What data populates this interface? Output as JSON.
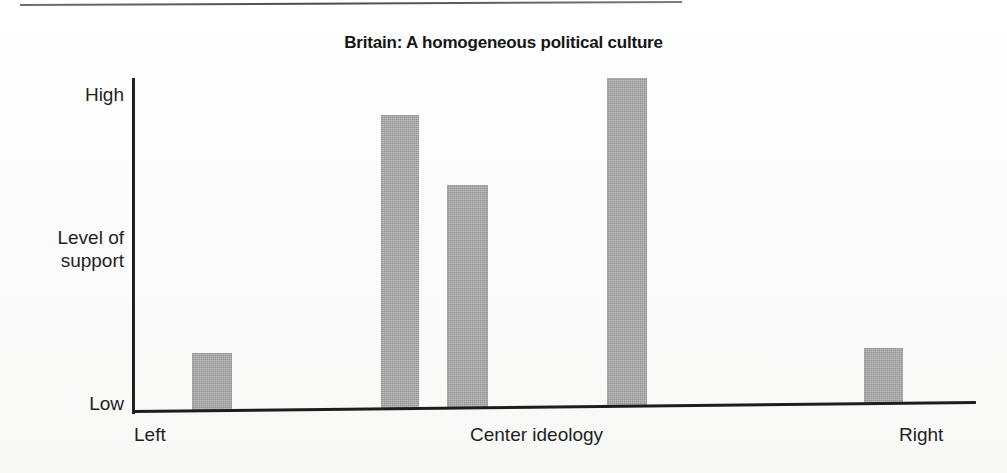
{
  "figure": {
    "title": "Britain: A homogeneous political culture",
    "top_rule": "divider-line"
  },
  "axes": {
    "y_top_label": "High",
    "y_middle_label": "Level of\nsupport",
    "y_bottom_label": "Low",
    "x_left_label": "Left",
    "x_center_label": "Center ideology",
    "x_right_label": "Right"
  },
  "colors": {
    "bar_fill": "#a3a3a3",
    "axis": "#1d1d1d",
    "text": "#1f1f1f",
    "background": "#fdfdfd"
  },
  "chart_data": {
    "type": "bar",
    "title": "Britain: A homogeneous political culture",
    "xlabel": "Center ideology",
    "ylabel": "Level of support",
    "categories": [
      "Left",
      "Center-left",
      "Center",
      "Center-right",
      "Right"
    ],
    "values": [
      18,
      89,
      68,
      100,
      19
    ],
    "ylim": [
      0,
      100
    ],
    "ytick_labels": [
      "Low",
      "High"
    ],
    "xtick_labels": [
      "Left",
      "Center ideology",
      "Right"
    ],
    "grid": false,
    "legend": "none",
    "bar_color": "#a3a3a3",
    "bars": [
      {
        "label": "Left",
        "value": 18,
        "x_px": 192,
        "width_px": 40,
        "top_px": 353
      },
      {
        "label": "Center-left",
        "value": 89,
        "x_px": 381,
        "width_px": 38,
        "top_px": 115
      },
      {
        "label": "Center",
        "value": 68,
        "x_px": 447,
        "width_px": 41,
        "top_px": 185
      },
      {
        "label": "Center-right",
        "value": 100,
        "x_px": 607,
        "width_px": 40,
        "top_px": 78
      },
      {
        "label": "Right",
        "value": 19,
        "x_px": 864,
        "width_px": 39,
        "top_px": 348
      }
    ]
  }
}
